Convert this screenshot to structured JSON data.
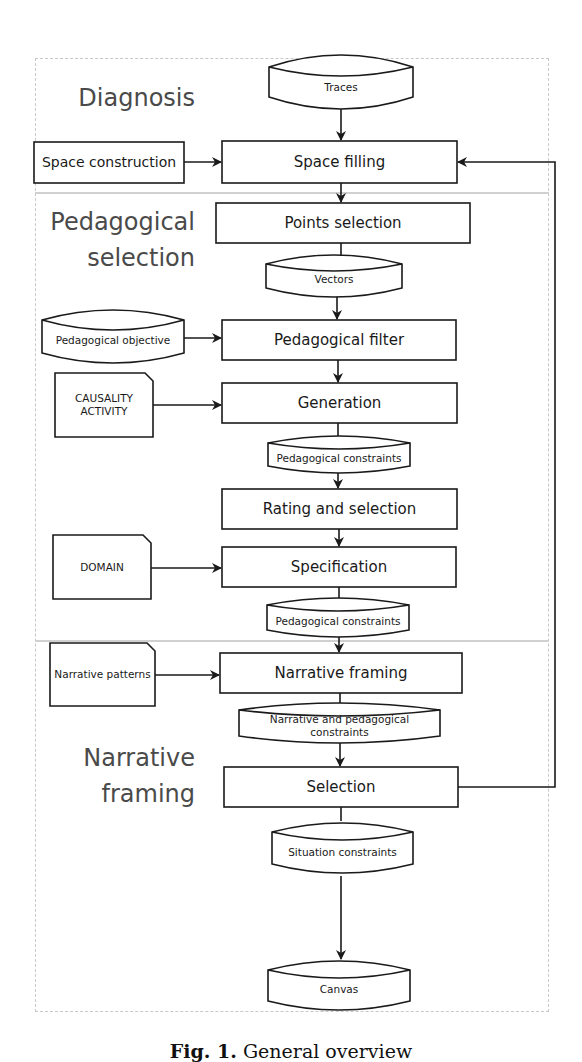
{
  "sections": {
    "diagnosis": "Diagnosis",
    "pedagogical_1": "Pedagogical",
    "pedagogical_2": "selection",
    "narrative_1": "Narrative",
    "narrative_2": "framing"
  },
  "nodes": {
    "traces": "Traces",
    "space_construction": "Space construction",
    "space_filling": "Space filling",
    "points_selection": "Points selection",
    "vectors": "Vectors",
    "pedagogical_objective": "Pedagogical objective",
    "pedagogical_filter": "Pedagogical filter",
    "causality_1": "CAUSALITY",
    "causality_2": "ACTIVITY",
    "generation": "Generation",
    "pedagogical_constraints_1": "Pedagogical constraints",
    "rating_selection": "Rating and selection",
    "domain": "DOMAIN",
    "specification": "Specification",
    "pedagogical_constraints_2": "Pedagogical constraints",
    "narrative_patterns": "Narrative patterns",
    "narrative_framing": "Narrative framing",
    "narrative_pedagogical_constraints": "Narrative and pedagogical constraints",
    "selection": "Selection",
    "situation_constraints": "Situation constraints",
    "canvas": "Canvas"
  },
  "caption": {
    "prefix": "Fig. 1.",
    "text": "General overview"
  }
}
